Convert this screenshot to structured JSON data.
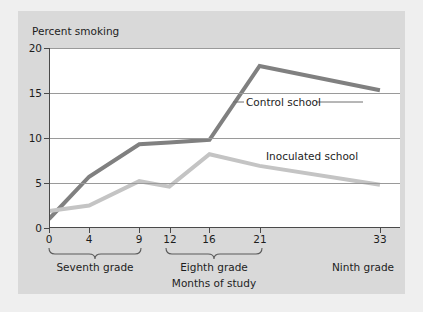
{
  "chart_data": {
    "type": "line",
    "title": "Percent smoking",
    "xlabel": "Months of study",
    "ylabel": "Percent smoking",
    "xlim": [
      0,
      35
    ],
    "ylim": [
      0,
      20
    ],
    "grid": true,
    "legend_position": "inline-annotations",
    "x": [
      0,
      4,
      9,
      12,
      16,
      21,
      33
    ],
    "xticklabels": [
      "0",
      "4",
      "9",
      "12",
      "16",
      "21",
      "33"
    ],
    "yticks": [
      0,
      5,
      10,
      15,
      20
    ],
    "yticklabels": [
      "0",
      "5",
      "10",
      "15",
      "20"
    ],
    "series": [
      {
        "name": "Control school",
        "color": "#808080",
        "values": [
          1.0,
          5.7,
          9.3,
          9.5,
          9.8,
          18.0,
          15.3
        ]
      },
      {
        "name": "Inoculated school",
        "color": "#c4c4c4",
        "values": [
          1.9,
          2.5,
          5.2,
          4.6,
          8.2,
          6.9,
          4.8
        ]
      }
    ],
    "annotations": [
      {
        "text": "Control school",
        "x": 19,
        "y": 15.6
      },
      {
        "text": "Inoculated school",
        "x": 24,
        "y": 10.6
      }
    ],
    "grade_brackets": [
      {
        "label": "Seventh grade",
        "start": 0,
        "end": 10
      },
      {
        "label": "Eighth grade",
        "start": 11.5,
        "end": 22
      },
      {
        "label": "Ninth grade",
        "start": 30,
        "end": 35
      }
    ]
  },
  "axis": {
    "ytick_0": "0",
    "ytick_5": "5",
    "ytick_10": "10",
    "ytick_15": "15",
    "ytick_20": "20",
    "xtick_0": "0",
    "xtick_4": "4",
    "xtick_9": "9",
    "xtick_12": "12",
    "xtick_16": "16",
    "xtick_21": "21",
    "xtick_33": "33"
  },
  "labels": {
    "title": "Percent smoking",
    "xaxis_title": "Months of study",
    "control_series": "Control school",
    "inoculated_series": "Inoculated school",
    "grade_seventh": "Seventh grade",
    "grade_eighth": "Eighth grade",
    "grade_ninth": "Ninth grade"
  }
}
